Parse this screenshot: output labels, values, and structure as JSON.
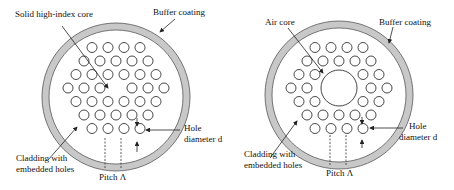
{
  "left": {
    "title": "Solid-core photonic crystal fiber",
    "labels": {
      "core": "Solid high-index core",
      "buffer": "Buffer coating",
      "cladding_1": "Cladding with",
      "cladding_2": "embedded holes",
      "hole_1": "Hole",
      "hole_2": "diameter d",
      "pitch": "Pitch Λ"
    },
    "hole_rows": [
      4,
      5,
      6,
      6,
      6,
      5,
      4
    ]
  },
  "right": {
    "title": "Hollow-core photonic crystal fiber",
    "labels": {
      "core": "Air core",
      "buffer": "Buffer coating",
      "cladding_1": "Cladding with",
      "cladding_2": "embedded holes",
      "hole_1": "Hole",
      "hole_2": "diameter d",
      "pitch": "Pitch Λ"
    },
    "hole_rows": [
      4,
      5,
      4,
      4,
      4,
      5,
      4
    ]
  },
  "colors": {
    "buffer_fill": "#c8c8c8",
    "stroke": "#333333"
  }
}
